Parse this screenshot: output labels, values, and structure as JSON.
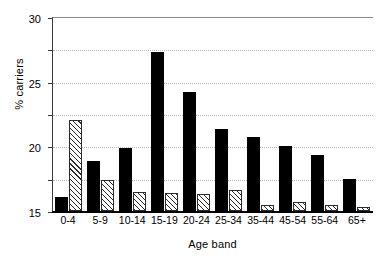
{
  "chart_data": {
    "type": "bar",
    "title": "",
    "xlabel": "Age band",
    "ylabel": "% carriers",
    "categories": [
      "0-4",
      "5-9",
      "10-14",
      "15-19",
      "20-24",
      "25-34",
      "35-44",
      "45-54",
      "55-64",
      "65+"
    ],
    "series": [
      {
        "name": "solid",
        "style": "solid-black",
        "color": "#000000",
        "values": [
          2.1,
          7.8,
          9.8,
          24.6,
          18.4,
          12.7,
          11.5,
          10.0,
          8.6,
          5.0
        ]
      },
      {
        "name": "hatched",
        "style": "diagonal-hatch",
        "color": "#2b2b2b",
        "values": [
          14.0,
          4.8,
          3.0,
          2.8,
          2.6,
          3.3,
          1.0,
          1.4,
          1.0,
          0.6
        ]
      }
    ],
    "ylim": [
      0,
      30
    ],
    "yticks": [
      0,
      5,
      10,
      15,
      20,
      25,
      30
    ],
    "ytick_labels": [
      "0",
      "5",
      "10",
      "15",
      "20",
      "25",
      "30"
    ],
    "grid": "horizontal-dotted",
    "legend": null
  }
}
